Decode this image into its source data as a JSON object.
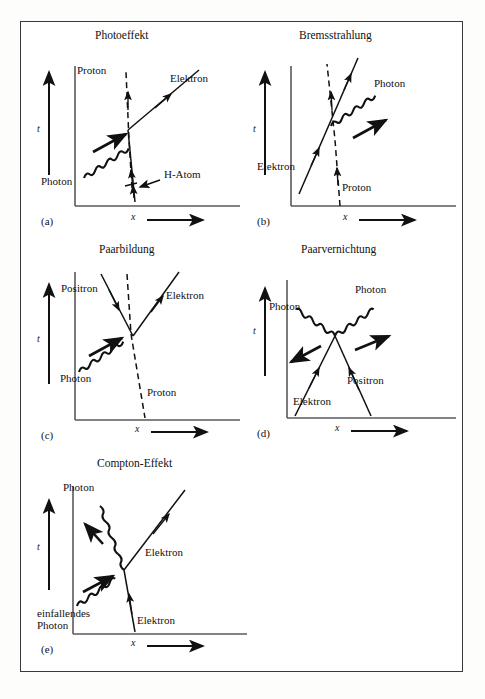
{
  "figure": {
    "kind": "feynman-spacetime-diagrams",
    "panel_count": 5,
    "axis_labels": {
      "time": "t",
      "space": "x"
    },
    "line_styles": {
      "photon": "wavy",
      "electron": "solid-straight",
      "positron": "solid-straight",
      "proton": "dashed"
    }
  },
  "panels": [
    {
      "id": "(a)",
      "title": "Photoeffekt",
      "axis_t": "t",
      "axis_x": "x",
      "labels": [
        {
          "text": "Proton",
          "particle": "proton"
        },
        {
          "text": "Elektron",
          "particle": "electron"
        },
        {
          "text": "Photon",
          "particle": "photon"
        },
        {
          "text": "H-Atom",
          "particle": "bound-state"
        }
      ]
    },
    {
      "id": "(b)",
      "title": "Bremsstrahlung",
      "axis_t": "t",
      "axis_x": "x",
      "labels": [
        {
          "text": "Photon",
          "particle": "photon"
        },
        {
          "text": "Elektron",
          "particle": "electron"
        },
        {
          "text": "Proton",
          "particle": "proton"
        }
      ]
    },
    {
      "id": "(c)",
      "title": "Paarbildung",
      "axis_t": "t",
      "axis_x": "x",
      "labels": [
        {
          "text": "Positron",
          "particle": "positron"
        },
        {
          "text": "Elektron",
          "particle": "electron"
        },
        {
          "text": "Photon",
          "particle": "photon"
        },
        {
          "text": "Proton",
          "particle": "proton"
        }
      ]
    },
    {
      "id": "(d)",
      "title": "Paarvernichtung",
      "axis_t": "t",
      "axis_x": "x",
      "labels": [
        {
          "text": "Photon",
          "particle": "photon"
        },
        {
          "text": "Photon",
          "particle": "photon"
        },
        {
          "text": "Elektron",
          "particle": "electron"
        },
        {
          "text": "Positron",
          "particle": "positron"
        }
      ]
    },
    {
      "id": "(e)",
      "title": "Compton-Effekt",
      "axis_t": "t",
      "axis_x": "x",
      "labels": [
        {
          "text": "Photon",
          "particle": "photon"
        },
        {
          "text": "Elektron",
          "particle": "electron"
        },
        {
          "text": "einfallendes\nPhoton",
          "particle": "photon"
        },
        {
          "text": "Elektron",
          "particle": "electron"
        }
      ]
    }
  ],
  "colors": {
    "ink": "#111111",
    "frame": "#3a3a3a",
    "paper": "#ffffff"
  }
}
